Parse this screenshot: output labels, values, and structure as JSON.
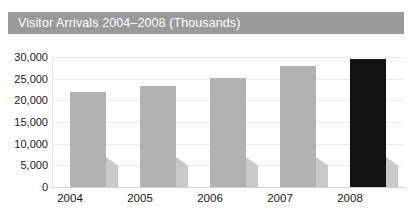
{
  "chart_data": {
    "type": "bar",
    "title": "Visitor Arrivals 2004–2008 (Thousands)",
    "xlabel": "",
    "ylabel": "",
    "categories": [
      "2004",
      "2005",
      "2006",
      "2007",
      "2008"
    ],
    "values": [
      21900,
      23200,
      25200,
      28000,
      29500
    ],
    "series": [
      {
        "name": "Visitor Arrivals",
        "values": [
          21900,
          23200,
          25200,
          28000,
          29500
        ]
      }
    ],
    "ylim": [
      0,
      30000
    ],
    "yticks": [
      0,
      5000,
      10000,
      15000,
      20000,
      25000,
      30000
    ],
    "ytick_labels": [
      "0",
      "5,000",
      "10,000",
      "15,000",
      "20,000",
      "25,000",
      "30,000"
    ],
    "grid": true,
    "legend": null,
    "bar_colors": [
      "#b2b2b2",
      "#b2b2b2",
      "#b2b2b2",
      "#b2b2b2",
      "#121212"
    ],
    "highlight_category": "2008",
    "colors": {
      "title_bar_background": "#9a9a9a",
      "title_text": "#ffffff",
      "bar_default": "#b2b2b2",
      "bar_highlight": "#121212",
      "bar_shadow": "#c9c9c9",
      "gridline": "#ebebeb",
      "axis_line": "#d2d2d2",
      "tick_label": "#1a1a1a",
      "plot_background": "#ffffff"
    }
  }
}
